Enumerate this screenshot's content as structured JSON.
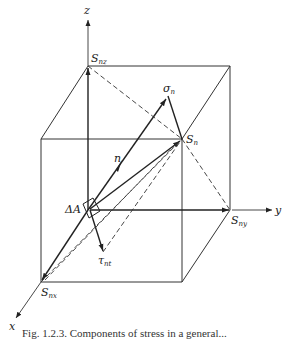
{
  "figure": {
    "caption": "Fig. 1.2.3. Components of stress in a general...",
    "axes": {
      "x_label": "x",
      "y_label": "y",
      "z_label": "z"
    },
    "labels": {
      "Snz": {
        "main": "S",
        "sub": "nz"
      },
      "Sny": {
        "main": "S",
        "sub": "ny"
      },
      "Snx": {
        "main": "S",
        "sub": "nx"
      },
      "Sn": {
        "main": "S",
        "sub": "n"
      },
      "sigma_n": {
        "main": "σ",
        "sub": "n"
      },
      "tau_nt": {
        "main": "τ",
        "sub": "nt"
      },
      "n": "n",
      "delta_A": "ΔA"
    },
    "colors": {
      "line": "#222222",
      "background": "#ffffff"
    }
  }
}
